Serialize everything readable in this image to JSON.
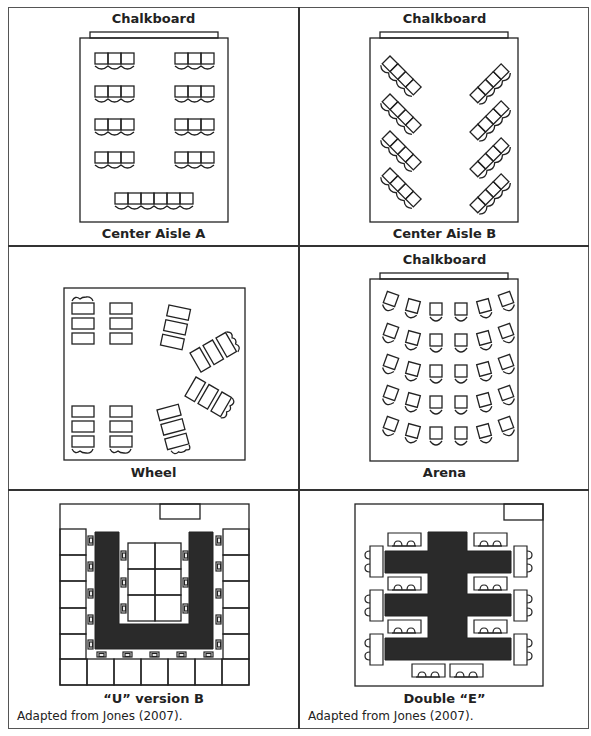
{
  "figure": {
    "panels": [
      {
        "id": "center-aisle-a",
        "top_label": "Chalkboard",
        "caption": "Center Aisle A",
        "credit": ""
      },
      {
        "id": "center-aisle-b",
        "top_label": "Chalkboard",
        "caption": "Center Aisle B",
        "credit": ""
      },
      {
        "id": "wheel",
        "top_label": "",
        "caption": "Wheel",
        "credit": ""
      },
      {
        "id": "arena",
        "top_label": "Chalkboard",
        "caption": "Arena",
        "credit": ""
      },
      {
        "id": "u-version-b",
        "top_label": "",
        "caption": "“U” version B",
        "credit": "Adapted from Jones (2007)."
      },
      {
        "id": "double-e",
        "top_label": "",
        "caption": "Double “E”",
        "credit": "Adapted from Jones (2007)."
      }
    ],
    "colors": {
      "line": "#222222",
      "table_fill": "#2a2a2a",
      "border": "#333333",
      "background": "#ffffff"
    }
  }
}
